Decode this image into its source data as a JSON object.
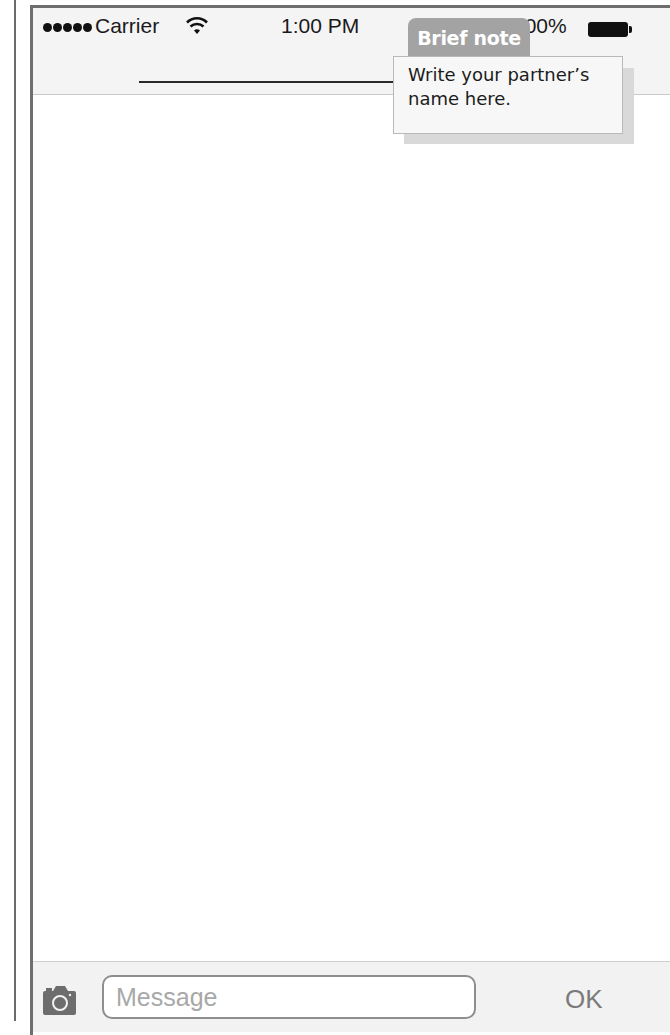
{
  "status_bar": {
    "signal_dots": 5,
    "carrier": "Carrier",
    "wifi_icon": "wifi-icon",
    "time": "1:00 PM",
    "battery_percent": "100%",
    "battery_icon": "battery-full-icon"
  },
  "nav_bar": {
    "title_placeholder_line": true
  },
  "annotation": {
    "tab_label": "Brief note",
    "text": "Write your partner’s name here."
  },
  "toolbar": {
    "camera_icon": "camera-icon",
    "message_placeholder": "Message",
    "message_value": "",
    "ok_label": "OK"
  },
  "colors": {
    "frame_border": "#6e6e6e",
    "nav_background": "#f4f4f4",
    "toolbar_background": "#f2f2f2",
    "note_tab": "#a3a3a3",
    "note_box": "#f7f7f7",
    "ok_text": "#7a7a7a"
  }
}
